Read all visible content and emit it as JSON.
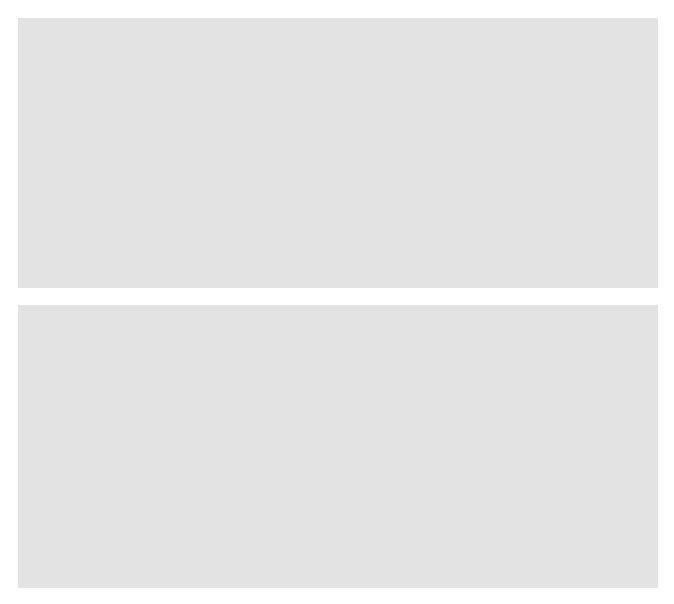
{
  "figure": {
    "background": "#ffffff",
    "panel_background": "#e3e3e3",
    "plot_background": "#ffffff",
    "axis_color": "#6d6e71",
    "grid_color": "#e8e8ea",
    "trace_color": "#808285",
    "annotation_color": "#231f20",
    "arrow_color": "#808285",
    "marker_color": "#808285"
  },
  "chart_data": [
    {
      "id": "top",
      "type": "line",
      "title": "",
      "xlabel": "Photon energy (keV)",
      "ylabel": "Counts",
      "xlim": [
        0.0,
        10.0
      ],
      "ylim": [
        0,
        100000
      ],
      "xticks": [
        "0.0",
        "1.0",
        "2.0",
        "3.0",
        "4.0",
        "5.0",
        "6.0",
        "7.0",
        "8.0",
        "9.0",
        "10.0"
      ],
      "xtick_values": [
        0,
        1,
        2,
        3,
        4,
        5,
        6,
        7,
        8,
        9,
        10
      ],
      "yticks": [
        "0",
        "20 000",
        "40 000",
        "60 000",
        "80 000",
        "100 000"
      ],
      "ytick_values": [
        0,
        20000,
        40000,
        60000,
        80000,
        100000
      ],
      "grid": true,
      "legend": {
        "position": "top-right",
        "entries": [
          {
            "label": "Mn_20kv10nA110kHz10DT",
            "color": "#808285",
            "marker": "square"
          }
        ]
      },
      "annotations": [
        {
          "name": "element-label",
          "text": "Mn",
          "x": 2.25,
          "y": 78000
        },
        {
          "name": "beam-energy-label",
          "text": "E",
          "sub": "0",
          "rest": " = 20 keV",
          "x": 2.25,
          "y": 71000
        }
      ],
      "peak_markers": [
        {
          "label": "Mn",
          "x": 0.637,
          "marker_y": 30000,
          "label_y": 37500,
          "name": "mn-l-peak-marker"
        },
        {
          "label": "Mn",
          "x": 0.637,
          "marker_y": 19000,
          "label_y": 26000,
          "name": "mn-l-peak-marker-2"
        },
        {
          "label": "Mn",
          "x": 0.72,
          "marker_y": 7000,
          "label_y": 14000,
          "name": "mn-l-peak-marker-3"
        },
        {
          "label": "Mn",
          "x": 5.899,
          "marker_y": 93000,
          "label_y": 99000,
          "name": "mn-ka-peak-marker"
        },
        {
          "label": "Mn",
          "x": 6.49,
          "marker_y": 13500,
          "label_y": 20500,
          "name": "mn-kb-peak-marker"
        }
      ],
      "peaks": [
        {
          "name": "noise",
          "center": 0.09,
          "height": 3000,
          "sigma": 0.04
        },
        {
          "name": "low-energy-bump",
          "center": 0.26,
          "height": 6200,
          "sigma": 0.075
        },
        {
          "name": "Mn L",
          "center": 0.637,
          "height": 31000,
          "sigma": 0.032
        },
        {
          "name": "escape-small",
          "center": 1.75,
          "height": 1500,
          "sigma": 0.12
        },
        {
          "name": "Mn K-L3",
          "center": 5.899,
          "height": 93000,
          "sigma": 0.0535
        },
        {
          "name": "Mn K-M3",
          "center": 6.49,
          "height": 13500,
          "sigma": 0.056
        }
      ],
      "background_level": 900
    },
    {
      "id": "bottom",
      "type": "line",
      "title": "",
      "xlabel": "Photon energy (keV)",
      "ylabel": "Counts",
      "xlim": [
        5.6,
        6.2
      ],
      "ylim": [
        0,
        100000
      ],
      "xticks": [
        "5.60",
        "5.65",
        "5.70",
        "5.75",
        "5.80",
        "5.85",
        "5.90",
        "5.95",
        "6.00",
        "6.05",
        "6.10",
        "6.15",
        "6.20"
      ],
      "xtick_values": [
        5.6,
        5.65,
        5.7,
        5.75,
        5.8,
        5.85,
        5.9,
        5.95,
        6.0,
        6.05,
        6.1,
        6.15,
        6.2
      ],
      "yticks": [
        "0",
        "20 000",
        "40 000",
        "60 000",
        "80 000",
        "100 000"
      ],
      "ytick_values": [
        0,
        20000,
        40000,
        60000,
        80000,
        100000
      ],
      "grid": true,
      "bin_width_kev": 0.005,
      "legend": {
        "position": "top-right",
        "entries": [
          {
            "label": "Mn_20kv10nA110kHz10DT",
            "color": "#808285",
            "marker": "square"
          }
        ]
      },
      "peak": {
        "center": 5.899,
        "height": 99000,
        "fwhm_kev": 0.126
      },
      "peak_lines": [
        {
          "label": "Mn K-L3",
          "x": 5.899,
          "top_y": 99000,
          "name": "mn-k-l3-line"
        },
        {
          "label": "Mn K-L2",
          "x": 5.888,
          "top_y": 50000,
          "name": "mn-k-l2-line"
        }
      ],
      "annotations": [
        {
          "name": "bin-width-annotation",
          "text": "5 eV bin width",
          "x": 5.975,
          "y": 66000
        },
        {
          "name": "fwhm-annotation",
          "text": "FWHM = 126 eV",
          "x": 5.945,
          "y": 43000
        }
      ],
      "fwhm_marker": {
        "name": "fwhm-arrow",
        "y": 50000,
        "x_left": 5.836,
        "x_right": 5.962,
        "label": "FWHM = 126 eV"
      },
      "bin_arrow": {
        "name": "bin-width-arrow",
        "tail_x": 5.992,
        "tail_y": 70000,
        "head_x": 5.958,
        "head_y": 53500
      }
    }
  ]
}
